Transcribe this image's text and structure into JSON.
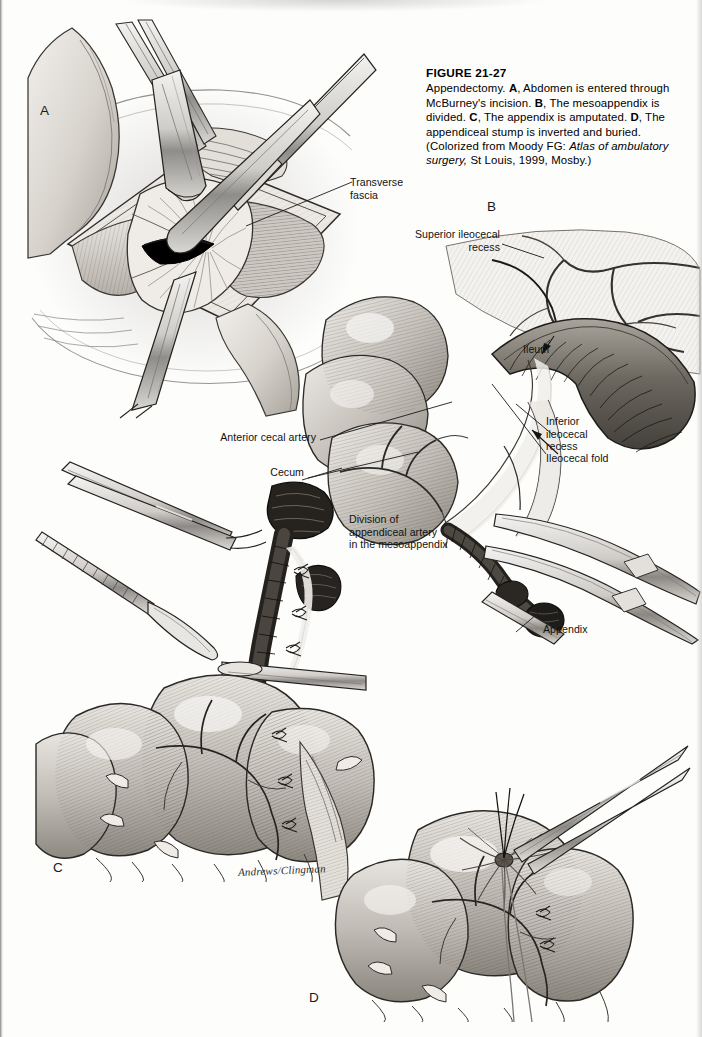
{
  "figure": {
    "number": "FIGURE 21-27",
    "caption_lead": "Appendectomy.",
    "parts": [
      {
        "letter": "A",
        "text": "Abdomen is entered through McBurney's incision."
      },
      {
        "letter": "B",
        "text": "The mesoappendix is divided."
      },
      {
        "letter": "C",
        "text": "The appendix is amputated."
      },
      {
        "letter": "D",
        "text": "The appendiceal stump is inverted and buried."
      }
    ],
    "source_prefix": "(Colorized from Moody FG:",
    "source_italic": "Atlas of ambulatory surgery,",
    "source_suffix": "St Louis, 1999, Mosby.)"
  },
  "panels": [
    {
      "id": "A",
      "letter": "A"
    },
    {
      "id": "B",
      "letter": "B"
    },
    {
      "id": "C",
      "letter": "C"
    },
    {
      "id": "D",
      "letter": "D"
    }
  ],
  "labels": {
    "transverse_fascia": "Transverse\nfascia",
    "superior_ileocecal_recess": "Superior ileocecal\nrecess",
    "ileum": "Ileum",
    "inferior_ileocecal_recess": "Inferior\nileocecal\nrecess",
    "ileocecal_fold": "Ileocecal fold",
    "anterior_cecal_artery": "Anterior cecal artery",
    "cecum": "Cecum",
    "division_of_appendiceal_artery": "Division of\nappendiceal artery\nin the mesoappendix",
    "appendix": "Appendix"
  },
  "artist_signature": "Andrews/Clingman",
  "colors": {
    "page_background": "#fdfdfc",
    "ink": "#111111",
    "tissue_light": "#dedad4",
    "tissue_mid": "#b8b3ac",
    "tissue_dark": "#6f6a64",
    "bowel_dark": "#3a3733",
    "instrument_steel": "#c9c7c3",
    "incision_black": "#000000"
  }
}
